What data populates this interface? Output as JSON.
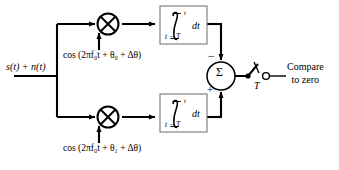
{
  "figure": {
    "type": "block-diagram",
    "input_label": "s(t) + n(t)",
    "branches": [
      {
        "id": "top",
        "mixer": "multiplier",
        "oscillator_label": "cos (2πf₀t + θ₀ + Δθ)",
        "oscillator_carrier": "2πf₀t",
        "oscillator_phase": "θ₀",
        "oscillator_phase_error": "Δθ",
        "integrator": {
          "symbol": "∫",
          "upper_limit": "t",
          "lower_limit": "t − T",
          "differential": "dt"
        },
        "summer_sign": "−"
      },
      {
        "id": "bottom",
        "mixer": "multiplier",
        "oscillator_label": "cos (2πf₀t + θ₁ + Δθ)",
        "oscillator_carrier": "2πf₀t",
        "oscillator_phase": "θ₁",
        "oscillator_phase_error": "Δθ",
        "integrator": {
          "symbol": "∫",
          "upper_limit": "t",
          "lower_limit": "t − T",
          "differential": "dt"
        },
        "summer_sign": "+"
      }
    ],
    "summer": {
      "symbol": "Σ",
      "top_input_sign": "−",
      "bottom_input_sign": "+"
    },
    "sampler": {
      "label": "T",
      "kind": "sampling-switch"
    },
    "output": {
      "line1": "Compare",
      "line2": "to zero"
    },
    "colors": {
      "background": "#ffffff",
      "line": "#000000",
      "box_border": "#555555",
      "text": "#000000"
    }
  }
}
